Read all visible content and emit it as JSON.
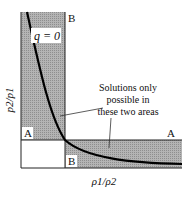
{
  "diagram": {
    "axes": {
      "x_label": "ρ1/ρ2",
      "y_label": "p2/p1"
    },
    "curve_label": "q = 0",
    "annotation": {
      "lines": [
        "Solutions only",
        "possible in",
        "these two areas"
      ]
    },
    "region_labels": {
      "vertical_band_top": "B",
      "vertical_band_bottom": "A",
      "horizontal_band_left": "B",
      "horizontal_band_right": "A"
    },
    "colors": {
      "shade": "#a8a8a8",
      "curve": "#000000",
      "frame": "#222222",
      "background": "#ffffff"
    }
  }
}
